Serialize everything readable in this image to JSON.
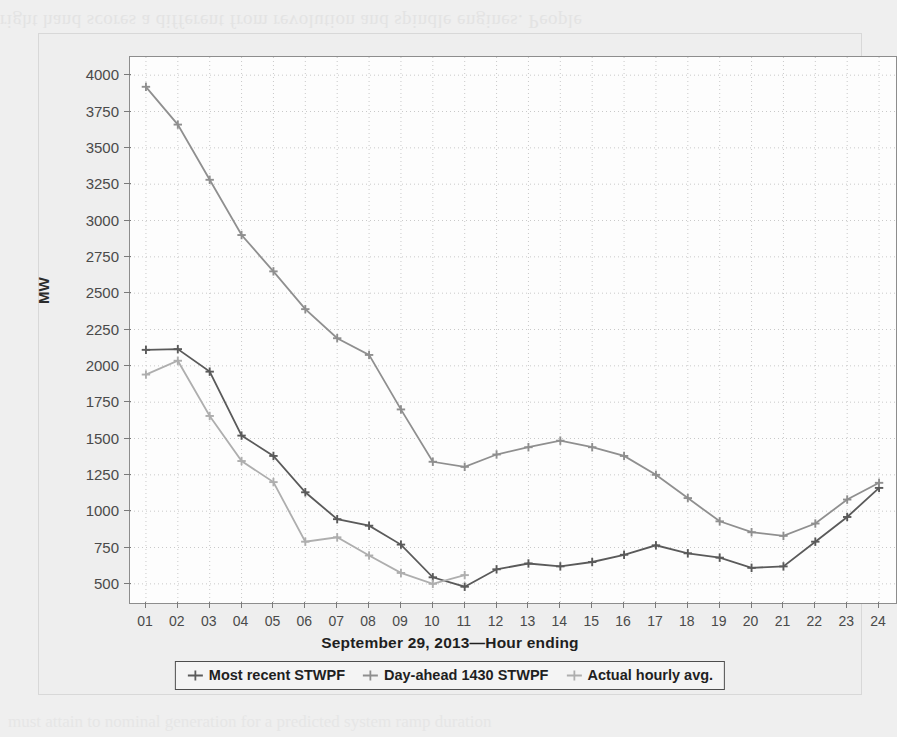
{
  "page": {
    "bleed_text_top": "right hand scores a different from revolution and spindle engines. People",
    "bleed_text_bottom": "must attain to nominal generation for a predicted system ramp duration"
  },
  "chart_data": {
    "type": "line",
    "title": "",
    "xlabel": "September 29, 2013—Hour ending",
    "ylabel": "MW",
    "x": [
      "01",
      "02",
      "03",
      "04",
      "05",
      "06",
      "07",
      "08",
      "09",
      "10",
      "11",
      "12",
      "13",
      "14",
      "15",
      "16",
      "17",
      "18",
      "19",
      "20",
      "21",
      "22",
      "23",
      "24"
    ],
    "ylim": [
      375,
      4125
    ],
    "yticks": [
      500,
      750,
      1000,
      1250,
      1500,
      1750,
      2000,
      2250,
      2500,
      2750,
      3000,
      3250,
      3500,
      3750,
      4000
    ],
    "grid": true,
    "legend_position": "below",
    "series": [
      {
        "name": "Most recent STWPF",
        "color": "#5a5a5a",
        "values": [
          2110,
          2115,
          1960,
          1520,
          1380,
          1130,
          945,
          900,
          770,
          545,
          480,
          600,
          640,
          620,
          650,
          700,
          765,
          710,
          680,
          610,
          620,
          790,
          960,
          1160
        ]
      },
      {
        "name": "Day-ahead 1430 STWPF",
        "color": "#8f8f8f",
        "values": [
          3920,
          3660,
          3280,
          2900,
          2650,
          2390,
          2190,
          2075,
          1700,
          1340,
          1305,
          1390,
          1440,
          1485,
          1440,
          1380,
          1250,
          1090,
          930,
          855,
          830,
          915,
          1080,
          1195
        ]
      },
      {
        "name": "Actual hourly avg.",
        "color": "#aeaeae",
        "values": [
          1940,
          2035,
          1655,
          1345,
          1200,
          790,
          820,
          695,
          575,
          500,
          560,
          null,
          null,
          null,
          null,
          null,
          null,
          null,
          null,
          null,
          null,
          null,
          null,
          null
        ]
      }
    ]
  },
  "axis": {
    "ytick_labels": [
      "4000",
      "3750",
      "3500",
      "3250",
      "3000",
      "2750",
      "2500",
      "2250",
      "2000",
      "1750",
      "1500",
      "1250",
      "1000",
      "750",
      "500"
    ]
  },
  "legend": {
    "items": [
      {
        "label": "Most recent STWPF",
        "color": "#5a5a5a"
      },
      {
        "label": "Day-ahead 1430 STWPF",
        "color": "#8f8f8f"
      },
      {
        "label": "Actual hourly avg.",
        "color": "#aeaeae"
      }
    ]
  }
}
